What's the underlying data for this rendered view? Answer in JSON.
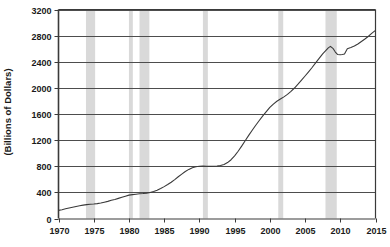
{
  "chart_data": {
    "type": "line",
    "title": "",
    "subtitle": "",
    "xlabel": "",
    "ylabel": "(Billions of Dollars)",
    "xlim": [
      1970,
      2015
    ],
    "ylim": [
      0,
      3200
    ],
    "grid": true,
    "legend": "none",
    "x_ticks": [
      "1970",
      "1975",
      "1980",
      "1985",
      "1990",
      "1995",
      "2000",
      "2005",
      "2010",
      "2015"
    ],
    "x_tick_values": [
      1970,
      1975,
      1980,
      1985,
      1990,
      1995,
      2000,
      2005,
      2010,
      2015
    ],
    "y_ticks": [
      "0",
      "400",
      "800",
      "1200",
      "1600",
      "2000",
      "2400",
      "2800",
      "3200"
    ],
    "y_tick_values": [
      0,
      400,
      800,
      1200,
      1600,
      2000,
      2400,
      2800,
      3200
    ],
    "series": [
      {
        "name": "value",
        "color": "#3a3a3a",
        "x": [
          1970.0,
          1970.5,
          1971.0,
          1971.5,
          1972.0,
          1972.5,
          1973.0,
          1973.5,
          1974.0,
          1974.5,
          1975.0,
          1975.5,
          1976.0,
          1976.5,
          1977.0,
          1977.5,
          1978.0,
          1978.5,
          1979.0,
          1979.5,
          1980.0,
          1980.5,
          1981.0,
          1981.5,
          1982.0,
          1982.5,
          1983.0,
          1983.5,
          1984.0,
          1984.5,
          1985.0,
          1985.5,
          1986.0,
          1986.5,
          1987.0,
          1987.5,
          1988.0,
          1988.5,
          1989.0,
          1989.5,
          1990.0,
          1990.5,
          1991.0,
          1991.5,
          1992.0,
          1992.5,
          1993.0,
          1993.5,
          1994.0,
          1994.5,
          1995.0,
          1995.5,
          1996.0,
          1996.5,
          1997.0,
          1997.5,
          1998.0,
          1998.5,
          1999.0,
          1999.5,
          2000.0,
          2000.5,
          2001.0,
          2001.5,
          2002.0,
          2002.5,
          2003.0,
          2003.5,
          2004.0,
          2004.5,
          2005.0,
          2005.5,
          2006.0,
          2006.5,
          2007.0,
          2007.5,
          2008.0,
          2008.3,
          2008.6,
          2009.0,
          2009.3,
          2009.6,
          2010.0,
          2010.3,
          2010.6,
          2011.0,
          2011.5,
          2012.0,
          2012.5,
          2013.0,
          2013.5,
          2014.0,
          2014.5,
          2015.0
        ],
        "y": [
          125,
          135,
          148,
          160,
          172,
          185,
          196,
          205,
          212,
          218,
          222,
          228,
          238,
          250,
          262,
          278,
          292,
          308,
          325,
          342,
          358,
          366,
          372,
          378,
          382,
          388,
          398,
          412,
          432,
          458,
          488,
          520,
          556,
          596,
          640,
          680,
          720,
          752,
          778,
          792,
          800,
          802,
          800,
          798,
          800,
          804,
          812,
          828,
          856,
          900,
          960,
          1030,
          1108,
          1190,
          1272,
          1352,
          1428,
          1500,
          1570,
          1636,
          1700,
          1752,
          1796,
          1830,
          1862,
          1900,
          1946,
          1998,
          2056,
          2118,
          2182,
          2246,
          2312,
          2382,
          2452,
          2520,
          2578,
          2612,
          2636,
          2600,
          2548,
          2512,
          2508,
          2512,
          2520,
          2600,
          2618,
          2640,
          2672,
          2710,
          2748,
          2790,
          2838,
          2880
        ]
      }
    ],
    "recession_bands": [
      {
        "label": "1973-75 recession",
        "start": 1973.9,
        "end": 1975.2
      },
      {
        "label": "1980 recession",
        "start": 1980.0,
        "end": 1980.55
      },
      {
        "label": "1981-82 recession",
        "start": 1981.5,
        "end": 1982.9
      },
      {
        "label": "1990-91 recession",
        "start": 1990.5,
        "end": 1991.2
      },
      {
        "label": "2001 recession",
        "start": 2001.2,
        "end": 2001.9
      },
      {
        "label": "2007-09 recession",
        "start": 2007.9,
        "end": 2009.5
      }
    ],
    "colors": {
      "line": "#3a3a3a",
      "gridline": "#4d4d4d",
      "axis": "#3a3a3a",
      "recession_band": "#d9d9d9",
      "background": "#ffffff",
      "text": "#1a1a1a"
    }
  }
}
